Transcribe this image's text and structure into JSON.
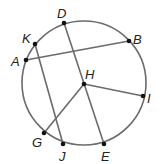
{
  "diagram": {
    "type": "circle-geometry",
    "circle": {
      "cx": 84,
      "cy": 83,
      "r": 62,
      "stroke": "#6b6b6b"
    },
    "points": {
      "D": {
        "x": 64,
        "y": 23,
        "label": "D",
        "lx": 57,
        "ly": 18
      },
      "K": {
        "x": 35,
        "y": 44,
        "label": "K",
        "lx": 22,
        "ly": 43
      },
      "A": {
        "x": 26,
        "y": 60,
        "label": "A",
        "lx": 11,
        "ly": 66
      },
      "B": {
        "x": 129,
        "y": 41,
        "label": "B",
        "lx": 133,
        "ly": 44
      },
      "H": {
        "x": 84,
        "y": 84,
        "label": "H",
        "lx": 85,
        "ly": 79
      },
      "I": {
        "x": 143,
        "y": 96,
        "label": "I",
        "lx": 147,
        "ly": 103
      },
      "G": {
        "x": 44,
        "y": 133,
        "label": "G",
        "lx": 32,
        "ly": 147
      },
      "J": {
        "x": 63,
        "y": 144,
        "label": "J",
        "lx": 59,
        "ly": 161
      },
      "E": {
        "x": 104,
        "y": 144,
        "label": "E",
        "lx": 101,
        "ly": 161
      }
    },
    "segments": [
      [
        "D",
        "E"
      ],
      [
        "K",
        "J"
      ],
      [
        "A",
        "B"
      ],
      [
        "H",
        "I"
      ],
      [
        "H",
        "G"
      ]
    ],
    "line_color": "#6b6b6b",
    "point_color": "#111111"
  }
}
